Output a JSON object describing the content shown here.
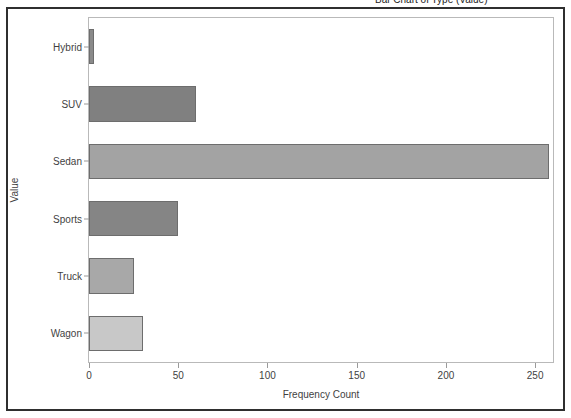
{
  "window": {
    "clipped_title": "Bar Chart of Type (Value)"
  },
  "chart_data": {
    "type": "bar",
    "orientation": "horizontal",
    "title": "",
    "xlabel": "Frequency Count",
    "ylabel": "Value",
    "categories": [
      "Hybrid",
      "SUV",
      "Sedan",
      "Sports",
      "Truck",
      "Wagon"
    ],
    "values": [
      3,
      60,
      258,
      50,
      25,
      30
    ],
    "xlim": [
      0,
      260
    ],
    "xticks": [
      0,
      50,
      100,
      150,
      200,
      250
    ],
    "xtick_labels": [
      "0",
      "50",
      "100",
      "150",
      "200",
      "250"
    ],
    "grid": false,
    "legend": null,
    "bar_colors": [
      "#8a8a8a",
      "#808080",
      "#a3a3a3",
      "#858585",
      "#a8a8a8",
      "#c8c8c8"
    ],
    "bar_edge_color": "#6d6d6d",
    "frame_color": "#b9b9b9",
    "outer_border_color": "#2f2f2f",
    "background": "#ffffff"
  }
}
